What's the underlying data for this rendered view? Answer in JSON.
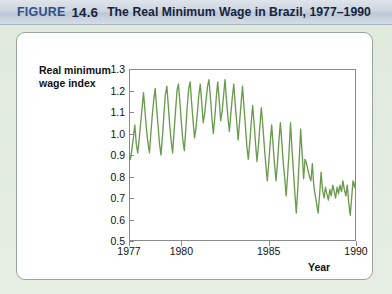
{
  "header": {
    "figure_word": "FIGURE",
    "figure_number": "14.6",
    "title": "The Real Minimum Wage in Brazil, 1977–1990"
  },
  "colors": {
    "header_band": "#ccd5e0",
    "header_text": "#16233c",
    "figure_word": "#2e4f86",
    "page_background": "#e3ecdd",
    "card_background": "#ffffff",
    "series_line": "#6b9b4f",
    "axis": "#8b8b8b"
  },
  "chart_data": {
    "type": "line",
    "title": "The Real Minimum Wage in Brazil, 1977–1990",
    "xlabel": "Year",
    "ylabel": "Real minimum wage index",
    "ylabel_line1": "Real minimum",
    "ylabel_line2": "wage index",
    "xlim": [
      1977,
      1990
    ],
    "ylim": [
      0.5,
      1.3
    ],
    "yticks": [
      0.5,
      0.6,
      0.7,
      0.8,
      0.9,
      1.0,
      1.1,
      1.2,
      1.3
    ],
    "ytick_labels": [
      "0.5",
      "0.6",
      "0.7",
      "0.8",
      "0.9",
      "1.0",
      "1.1",
      "1.2",
      "1.3"
    ],
    "xticks": [
      1977,
      1980,
      1985,
      1990
    ],
    "xtick_labels": [
      "1977",
      "1980",
      "1985",
      "1990"
    ],
    "grid": false,
    "legend": false,
    "series": [
      {
        "name": "Real minimum wage index",
        "color": "#6b9b4f",
        "x": [
          1977.0,
          1977.08,
          1977.17,
          1977.25,
          1977.33,
          1977.42,
          1977.5,
          1977.58,
          1977.67,
          1977.75,
          1977.83,
          1977.92,
          1978.0,
          1978.08,
          1978.17,
          1978.25,
          1978.33,
          1978.42,
          1978.5,
          1978.58,
          1978.67,
          1978.75,
          1978.83,
          1978.92,
          1979.0,
          1979.08,
          1979.17,
          1979.25,
          1979.33,
          1979.42,
          1979.5,
          1979.58,
          1979.67,
          1979.75,
          1979.83,
          1979.92,
          1980.0,
          1980.08,
          1980.17,
          1980.25,
          1980.33,
          1980.42,
          1980.5,
          1980.58,
          1980.67,
          1980.75,
          1980.83,
          1980.92,
          1981.0,
          1981.08,
          1981.17,
          1981.25,
          1981.33,
          1981.42,
          1981.5,
          1981.58,
          1981.67,
          1981.75,
          1981.83,
          1981.92,
          1982.0,
          1982.08,
          1982.17,
          1982.25,
          1982.33,
          1982.42,
          1982.5,
          1982.58,
          1982.67,
          1982.75,
          1982.83,
          1982.92,
          1983.0,
          1983.08,
          1983.17,
          1983.25,
          1983.33,
          1983.42,
          1983.5,
          1983.58,
          1983.67,
          1983.75,
          1983.83,
          1983.92,
          1984.0,
          1984.08,
          1984.17,
          1984.25,
          1984.33,
          1984.42,
          1984.5,
          1984.58,
          1984.67,
          1984.75,
          1984.83,
          1984.92,
          1985.0,
          1985.08,
          1985.17,
          1985.25,
          1985.33,
          1985.42,
          1985.5,
          1985.58,
          1985.67,
          1985.75,
          1985.83,
          1985.92,
          1986.0,
          1986.08,
          1986.17,
          1986.25,
          1986.33,
          1986.42,
          1986.5,
          1986.58,
          1986.67,
          1986.75,
          1986.83,
          1986.92,
          1987.0,
          1987.08,
          1987.17,
          1987.25,
          1987.33,
          1987.42,
          1987.5,
          1987.58,
          1987.67,
          1987.75,
          1987.83,
          1987.92,
          1988.0,
          1988.08,
          1988.17,
          1988.25,
          1988.33,
          1988.42,
          1988.5,
          1988.58,
          1988.67,
          1988.75,
          1988.83,
          1988.92,
          1989.0,
          1989.08,
          1989.17,
          1989.25,
          1989.33,
          1989.42,
          1989.5,
          1989.58,
          1989.67,
          1989.75,
          1989.83,
          1989.92,
          1990.0
        ],
        "y": [
          0.9,
          0.88,
          0.93,
          0.98,
          1.04,
          0.95,
          0.91,
          0.97,
          1.05,
          1.12,
          1.19,
          1.1,
          1.02,
          0.96,
          0.91,
          1.0,
          1.08,
          1.16,
          1.21,
          1.12,
          1.03,
          0.95,
          0.9,
          0.99,
          1.09,
          1.18,
          1.22,
          1.13,
          1.04,
          0.96,
          0.91,
          1.01,
          1.11,
          1.2,
          1.23,
          1.14,
          1.05,
          0.97,
          0.92,
          1.02,
          1.12,
          1.21,
          1.24,
          1.15,
          1.06,
          0.98,
          1.02,
          1.1,
          1.18,
          1.23,
          1.14,
          1.05,
          1.09,
          1.16,
          1.22,
          1.25,
          1.16,
          1.07,
          1.0,
          1.08,
          1.17,
          1.24,
          1.15,
          1.06,
          1.1,
          1.18,
          1.25,
          1.16,
          1.07,
          1.01,
          1.09,
          1.17,
          1.23,
          1.14,
          1.05,
          0.97,
          1.05,
          1.14,
          1.22,
          1.13,
          1.03,
          0.94,
          0.88,
          0.96,
          1.05,
          1.13,
          1.04,
          0.95,
          0.87,
          0.95,
          1.04,
          1.12,
          1.03,
          0.94,
          0.86,
          0.78,
          0.86,
          0.95,
          1.04,
          0.95,
          0.86,
          0.78,
          0.86,
          0.96,
          1.05,
          0.96,
          0.87,
          0.79,
          0.71,
          0.8,
          0.92,
          1.05,
          0.93,
          0.82,
          0.72,
          0.63,
          0.75,
          0.88,
          1.02,
          0.9,
          0.79,
          0.88,
          0.86,
          0.83,
          0.8,
          0.78,
          0.86,
          0.76,
          0.71,
          0.67,
          0.63,
          0.72,
          0.82,
          0.74,
          0.7,
          0.75,
          0.72,
          0.69,
          0.74,
          0.71,
          0.76,
          0.73,
          0.7,
          0.75,
          0.72,
          0.76,
          0.73,
          0.78,
          0.74,
          0.71,
          0.76,
          0.68,
          0.62,
          0.7,
          0.78,
          0.75,
          0.79
        ]
      }
    ],
    "annotations": []
  }
}
